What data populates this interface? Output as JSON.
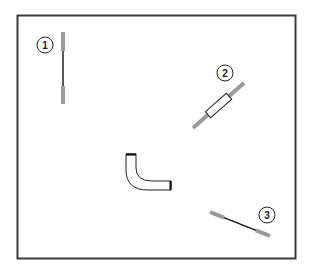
{
  "diagram": {
    "title": "",
    "frame": {
      "x": 17,
      "y": 15,
      "width": 279,
      "height": 244,
      "stroke": "#3a3a3a"
    },
    "colors": {
      "rod_gray": "#9a9a9a",
      "line_black": "#111111",
      "sleeve_fill": "#ffffff",
      "outline": "#222222"
    },
    "callouts": [
      {
        "id": 1,
        "label": "1",
        "cx": 45,
        "cy": 45
      },
      {
        "id": 2,
        "label": "2",
        "cx": 225,
        "cy": 73
      },
      {
        "id": 3,
        "label": "3",
        "cx": 267,
        "cy": 215
      }
    ],
    "parts": [
      {
        "id": "part-1",
        "name": "cable-with-gray-ends-vertical",
        "callout": "1"
      },
      {
        "id": "part-2",
        "name": "rod-with-white-sleeve-diagonal",
        "callout": "2"
      },
      {
        "id": "part-3",
        "name": "cable-with-gray-ends-diagonal",
        "callout": "3"
      },
      {
        "id": "part-4",
        "name": "elbow-hose",
        "callout": ""
      }
    ]
  }
}
